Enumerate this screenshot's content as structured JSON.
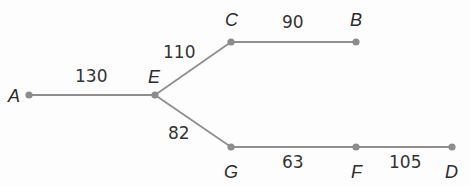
{
  "diagram": {
    "type": "weighted-graph",
    "colors": {
      "edge": "#8f8f8f",
      "node": "#8c8c8c",
      "text": "#2b2b2b",
      "background": "#fdfdfd"
    },
    "nodes": [
      {
        "id": "A",
        "label": "A",
        "x": 29,
        "y": 95,
        "label_x": 8,
        "label_y": 102
      },
      {
        "id": "E",
        "label": "E",
        "x": 155,
        "y": 95,
        "label_x": 148,
        "label_y": 83
      },
      {
        "id": "C",
        "label": "C",
        "x": 231,
        "y": 42,
        "label_x": 225,
        "label_y": 26
      },
      {
        "id": "B",
        "label": "B",
        "x": 356,
        "y": 42,
        "label_x": 350,
        "label_y": 26
      },
      {
        "id": "G",
        "label": "G",
        "x": 231,
        "y": 147,
        "label_x": 224,
        "label_y": 178
      },
      {
        "id": "F",
        "label": "F",
        "x": 356,
        "y": 147,
        "label_x": 351,
        "label_y": 178
      },
      {
        "id": "D",
        "label": "D",
        "x": 452,
        "y": 147,
        "label_x": 445,
        "label_y": 178
      }
    ],
    "edges": [
      {
        "from": "A",
        "to": "E",
        "weight": "130",
        "label_x": 75,
        "label_y": 82
      },
      {
        "from": "E",
        "to": "C",
        "weight": "110",
        "label_x": 163,
        "label_y": 58
      },
      {
        "from": "C",
        "to": "B",
        "weight": "90",
        "label_x": 282,
        "label_y": 28
      },
      {
        "from": "E",
        "to": "G",
        "weight": "82",
        "label_x": 168,
        "label_y": 139
      },
      {
        "from": "G",
        "to": "F",
        "weight": "63",
        "label_x": 282,
        "label_y": 168
      },
      {
        "from": "F",
        "to": "D",
        "weight": "105",
        "label_x": 389,
        "label_y": 168
      }
    ]
  }
}
